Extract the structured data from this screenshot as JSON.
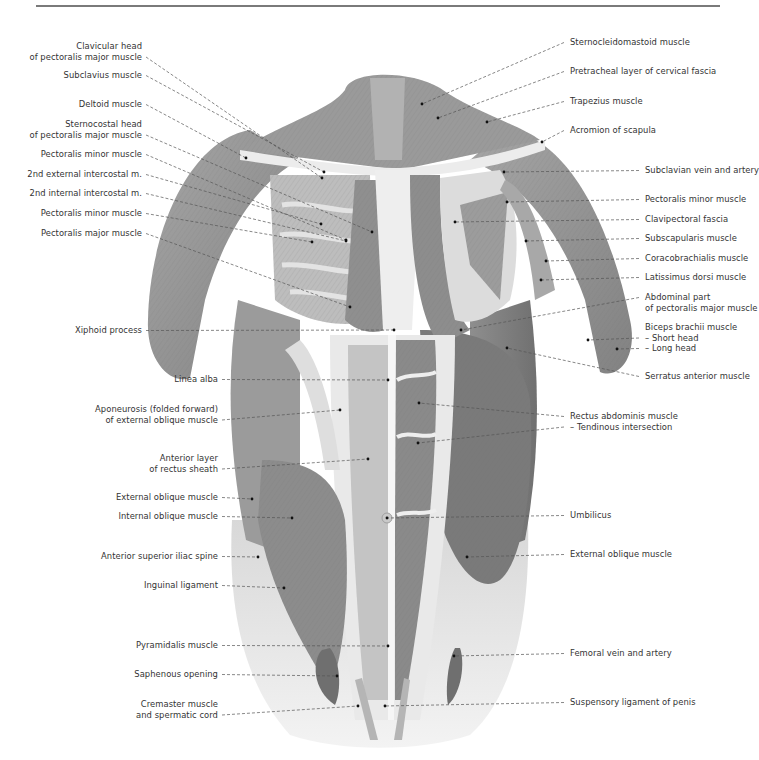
{
  "figure": {
    "colors": {
      "background": "#ffffff",
      "rule": "#7a7a7a",
      "text": "#333333",
      "leader": "#555555",
      "muscle_dark": "#7d7d7d",
      "muscle_mid": "#9c9c9c",
      "fascia_light": "#e6e6e6"
    }
  },
  "labels_left": [
    {
      "lines": [
        "Clavicular head",
        "of pectoralis major muscle"
      ],
      "x": 142,
      "y": 41,
      "target": [
        322,
        178
      ]
    },
    {
      "lines": [
        "Subclavius muscle"
      ],
      "x": 142,
      "y": 70,
      "target": [
        324,
        172
      ]
    },
    {
      "lines": [
        "Deltoid muscle"
      ],
      "x": 142,
      "y": 99,
      "target": [
        246,
        158
      ]
    },
    {
      "lines": [
        "Sternocostal head",
        "of pectoralis major muscle"
      ],
      "x": 142,
      "y": 119,
      "target": [
        372,
        232
      ]
    },
    {
      "lines": [
        "Pectoralis minor muscle"
      ],
      "x": 142,
      "y": 149,
      "target": [
        346,
        240
      ]
    },
    {
      "lines": [
        "2nd external intercostal m."
      ],
      "x": 142,
      "y": 169,
      "target": [
        321,
        224
      ]
    },
    {
      "lines": [
        "2nd internal intercostal m."
      ],
      "x": 142,
      "y": 188,
      "target": [
        346,
        241
      ]
    },
    {
      "lines": [
        "Pectoralis minor muscle"
      ],
      "x": 142,
      "y": 208,
      "target": [
        312,
        242
      ]
    },
    {
      "lines": [
        "Pectoralis major muscle"
      ],
      "x": 142,
      "y": 228,
      "target": [
        350,
        307
      ]
    },
    {
      "lines": [
        "Xiphoid process"
      ],
      "x": 142,
      "y": 325,
      "target": [
        394,
        330
      ]
    },
    {
      "lines": [
        "Linea alba"
      ],
      "x": 218,
      "y": 374,
      "target": [
        388,
        380
      ]
    },
    {
      "lines": [
        "Aponeurosis (folded forward)",
        "of external oblique muscle"
      ],
      "x": 218,
      "y": 404,
      "target": [
        340,
        410
      ]
    },
    {
      "lines": [
        "Anterior layer",
        "of rectus sheath"
      ],
      "x": 218,
      "y": 453,
      "target": [
        368,
        459
      ]
    },
    {
      "lines": [
        "External oblique muscle"
      ],
      "x": 218,
      "y": 492,
      "target": [
        252,
        499
      ]
    },
    {
      "lines": [
        "Internal oblique muscle"
      ],
      "x": 218,
      "y": 511,
      "target": [
        292,
        518
      ]
    },
    {
      "lines": [
        "Anterior superior iliac spine"
      ],
      "x": 218,
      "y": 551,
      "target": [
        258,
        557
      ]
    },
    {
      "lines": [
        "Inguinal ligament"
      ],
      "x": 218,
      "y": 580,
      "target": [
        284,
        588
      ]
    },
    {
      "lines": [
        "Pyramidalis muscle"
      ],
      "x": 218,
      "y": 640,
      "target": [
        388,
        646
      ]
    },
    {
      "lines": [
        "Saphenous opening"
      ],
      "x": 218,
      "y": 669,
      "target": [
        337,
        676
      ]
    },
    {
      "lines": [
        "Cremaster muscle",
        "and spermatic cord"
      ],
      "x": 218,
      "y": 699,
      "target": [
        358,
        706
      ]
    }
  ],
  "labels_right": [
    {
      "lines": [
        "Sternocleidomastoid muscle"
      ],
      "x": 570,
      "y": 37,
      "target": [
        422,
        104
      ]
    },
    {
      "lines": [
        "Pretracheal layer of cervical fascia"
      ],
      "x": 570,
      "y": 66,
      "target": [
        438,
        118
      ]
    },
    {
      "lines": [
        "Trapezius muscle"
      ],
      "x": 570,
      "y": 96,
      "target": [
        487,
        122
      ]
    },
    {
      "lines": [
        "Acromion of scapula"
      ],
      "x": 570,
      "y": 125,
      "target": [
        542,
        142
      ]
    },
    {
      "lines": [
        "Subclavian vein and artery"
      ],
      "x": 645,
      "y": 165,
      "target": [
        504,
        172
      ]
    },
    {
      "lines": [
        "Pectoralis minor muscle"
      ],
      "x": 645,
      "y": 194,
      "target": [
        507,
        202
      ]
    },
    {
      "lines": [
        "Clavipectoral fascia"
      ],
      "x": 645,
      "y": 214,
      "target": [
        455,
        222
      ]
    },
    {
      "lines": [
        "Subscapularis muscle"
      ],
      "x": 645,
      "y": 233,
      "target": [
        526,
        241
      ]
    },
    {
      "lines": [
        "Coracobrachialis muscle"
      ],
      "x": 645,
      "y": 253,
      "target": [
        546,
        261
      ]
    },
    {
      "lines": [
        "Latissimus dorsi muscle"
      ],
      "x": 645,
      "y": 272,
      "target": [
        541,
        280
      ]
    },
    {
      "lines": [
        "Abdominal part",
        "of pectoralis major muscle"
      ],
      "x": 645,
      "y": 292,
      "target": [
        461,
        330
      ]
    },
    {
      "lines": [
        "Biceps brachii muscle",
        "– Short head",
        "– Long head"
      ],
      "x": 645,
      "y": 322,
      "targets": [
        [
          588,
          340
        ],
        [
          617,
          349
        ]
      ]
    },
    {
      "lines": [
        "Serratus anterior muscle"
      ],
      "x": 645,
      "y": 371,
      "target": [
        507,
        348
      ]
    },
    {
      "lines": [
        "Rectus abdominis muscle",
        "– Tendinous intersection"
      ],
      "x": 570,
      "y": 411,
      "targets": [
        [
          419,
          403
        ],
        [
          418,
          443
        ]
      ]
    },
    {
      "lines": [
        "Umbilicus"
      ],
      "x": 570,
      "y": 510,
      "target": [
        387,
        518
      ]
    },
    {
      "lines": [
        "External oblique muscle"
      ],
      "x": 570,
      "y": 549,
      "target": [
        467,
        557
      ]
    },
    {
      "lines": [
        "Femoral vein and artery"
      ],
      "x": 570,
      "y": 648,
      "target": [
        454,
        656
      ]
    },
    {
      "lines": [
        "Suspensory ligament of penis"
      ],
      "x": 570,
      "y": 697,
      "target": [
        385,
        706
      ]
    }
  ]
}
